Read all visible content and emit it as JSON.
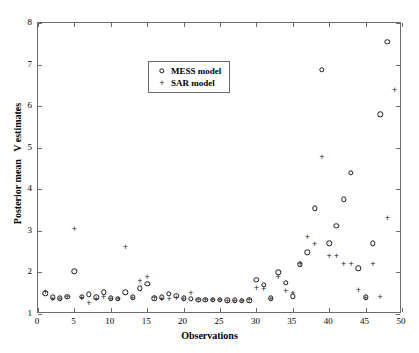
{
  "chart_data": {
    "type": "scatter",
    "title": "",
    "xlabel": "Observations",
    "ylabel": "Posterior mean  ν estimates",
    "ylabel_display": "Posterior mean   V estimates",
    "xlim": [
      0,
      50
    ],
    "ylim": [
      1,
      8
    ],
    "xticks": [
      0,
      5,
      10,
      15,
      20,
      25,
      30,
      35,
      40,
      45,
      50
    ],
    "yticks": [
      1,
      2,
      3,
      4,
      5,
      6,
      7,
      8
    ],
    "grid": false,
    "legend_position": "upper center",
    "series": [
      {
        "name": "MESS model",
        "marker": "circle",
        "color": "#1a1a1a",
        "x": [
          1,
          2,
          3,
          4,
          5,
          6,
          7,
          8,
          9,
          10,
          11,
          12,
          13,
          14,
          15,
          16,
          17,
          18,
          19,
          20,
          21,
          22,
          23,
          24,
          25,
          26,
          27,
          28,
          29,
          30,
          31,
          32,
          33,
          34,
          35,
          36,
          37,
          38,
          39,
          40,
          41,
          42,
          43,
          44,
          45,
          46,
          47,
          48
        ],
        "y": [
          1.5,
          1.4,
          1.38,
          1.42,
          2.03,
          1.42,
          1.47,
          1.4,
          1.52,
          1.38,
          1.37,
          1.52,
          1.4,
          1.62,
          1.72,
          1.38,
          1.4,
          1.48,
          1.44,
          1.38,
          1.36,
          1.34,
          1.34,
          1.34,
          1.34,
          1.33,
          1.33,
          1.32,
          1.33,
          1.82,
          1.7,
          1.38,
          2.0,
          1.75,
          1.43,
          2.2,
          2.48,
          3.54,
          6.88,
          2.7,
          3.12,
          3.76,
          4.4,
          2.1,
          1.4,
          2.7,
          5.8,
          7.55
        ]
      },
      {
        "name": "SAR model",
        "marker": "plus",
        "color": "#1a1a1a",
        "x": [
          1,
          2,
          3,
          4,
          5,
          6,
          7,
          8,
          9,
          10,
          11,
          12,
          13,
          14,
          15,
          16,
          17,
          18,
          19,
          20,
          21,
          22,
          23,
          24,
          25,
          26,
          27,
          28,
          29,
          30,
          31,
          32,
          33,
          34,
          35,
          36,
          37,
          38,
          39,
          40,
          41,
          42,
          43,
          44,
          45,
          46,
          47,
          48,
          49
        ],
        "y": [
          1.54,
          1.37,
          1.36,
          1.4,
          3.05,
          1.38,
          1.26,
          1.36,
          1.42,
          1.36,
          1.35,
          2.62,
          1.38,
          1.8,
          1.88,
          1.38,
          1.36,
          1.37,
          1.38,
          1.35,
          1.5,
          1.33,
          1.33,
          1.33,
          1.33,
          1.32,
          1.32,
          1.32,
          1.33,
          1.62,
          1.6,
          1.37,
          1.88,
          1.55,
          1.5,
          2.2,
          2.86,
          2.68,
          4.78,
          2.4,
          2.4,
          2.2,
          2.2,
          1.58,
          1.38,
          2.2,
          1.4,
          3.3,
          6.4
        ]
      }
    ]
  },
  "legend": {
    "entries": [
      {
        "label": "MESS model",
        "marker": "circle"
      },
      {
        "label": "SAR model",
        "marker": "plus"
      }
    ]
  }
}
